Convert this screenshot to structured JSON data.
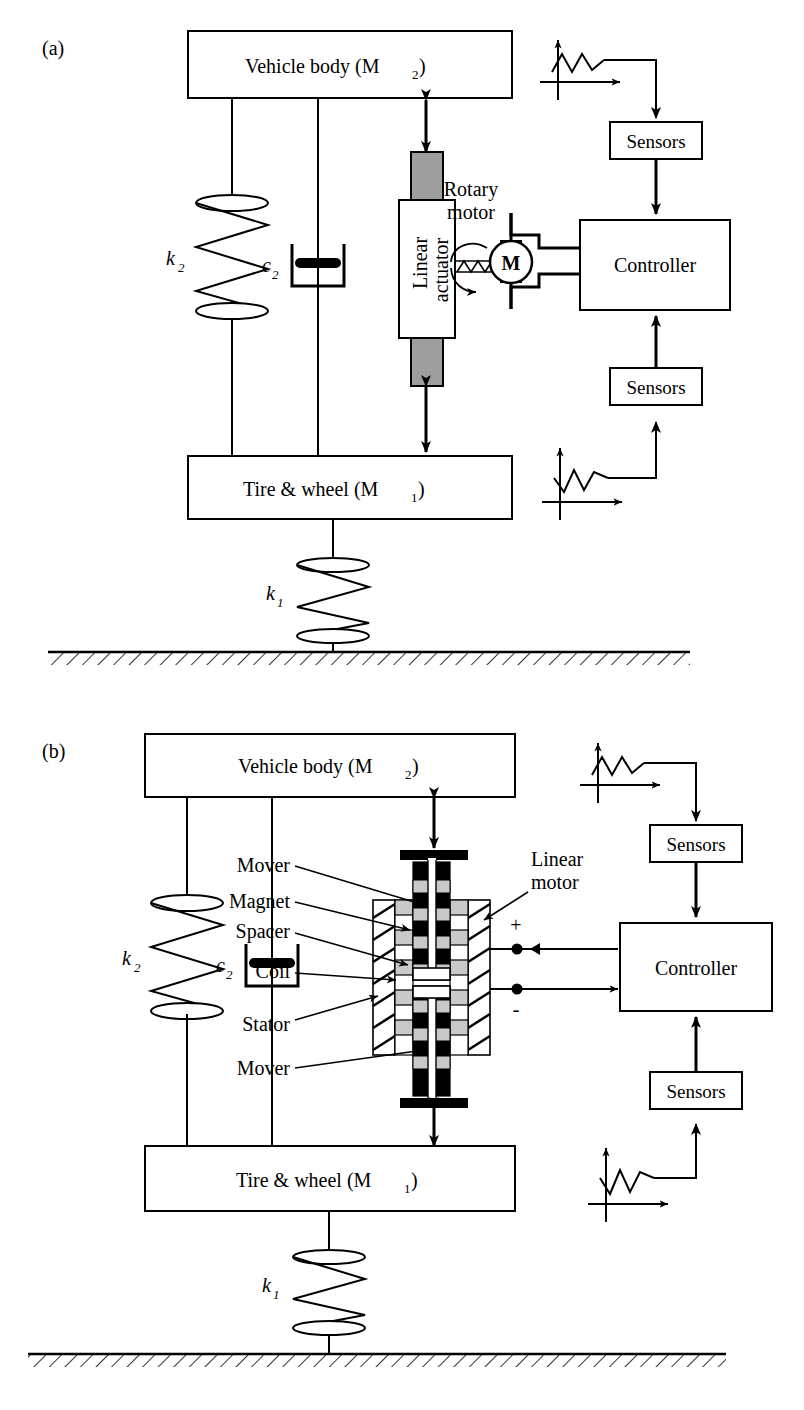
{
  "figure": {
    "panels": [
      {
        "id": "a",
        "label": "(a)",
        "vehicle_body": "Vehicle body (M",
        "vehicle_body_sub": "2",
        "vehicle_body_close": ")",
        "tire_wheel": "Tire & wheel (M",
        "tire_wheel_sub": "1",
        "tire_wheel_close": ")",
        "spring_k2": "k",
        "spring_k2_sub": "2",
        "damper_c2": "c",
        "damper_c2_sub": "2",
        "spring_k1": "k",
        "spring_k1_sub": "1",
        "actuator_line1": "Linear",
        "actuator_line2": "actuator",
        "motor_line1": "Rotary",
        "motor_line2": "motor",
        "motor_symbol": "M",
        "controller": "Controller",
        "sensors_top": "Sensors",
        "sensors_bottom": "Sensors"
      },
      {
        "id": "b",
        "label": "(b)",
        "vehicle_body": "Vehicle body (M",
        "vehicle_body_sub": "2",
        "vehicle_body_close": ")",
        "tire_wheel": "Tire & wheel (M",
        "tire_wheel_sub": "1",
        "tire_wheel_close": ")",
        "spring_k2": "k",
        "spring_k2_sub": "2",
        "damper_c2": "c",
        "damper_c2_sub": "2",
        "spring_k1": "k",
        "spring_k1_sub": "1",
        "callout_mover_top": "Mover",
        "callout_magnet": "Magnet",
        "callout_spacer": "Spacer",
        "callout_coil": "Coil",
        "callout_stator": "Stator",
        "callout_mover_bottom": "Mover",
        "callout_linear_motor_line1": "Linear",
        "callout_linear_motor_line2": "motor",
        "terminal_plus": "+",
        "terminal_minus": "-",
        "controller": "Controller",
        "sensors_top": "Sensors",
        "sensors_bottom": "Sensors"
      }
    ],
    "colors": {
      "stroke": "#000000",
      "background": "#ffffff",
      "actuator_rod_fill": "#9e9e9e",
      "magnet_fill": "#000000",
      "spacer_fill": "#c9c9c9",
      "coil_fill": "#ffffff"
    }
  }
}
